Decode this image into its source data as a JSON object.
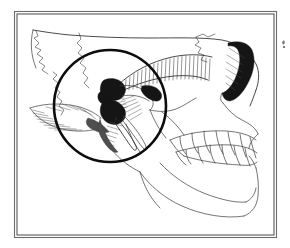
{
  "figure": {
    "title": "Lateral skull illustration with temporomandibular joint highlighted",
    "caption": "",
    "background_color": "#ffffff",
    "ink_color": "#2b2b2b",
    "frame": {
      "name": "image-border",
      "style": "double thin rectangle",
      "color_outer": "#6d6d6d",
      "color_inner": "#4a4a4a",
      "x": 14,
      "y": 11,
      "width": 263,
      "height": 227
    },
    "highlight": {
      "name": "tmj-highlight-circle",
      "shape": "circle",
      "color": "#0d0d0d",
      "stroke_width": 2.6,
      "center_x": 110,
      "center_y": 106,
      "radius": 56,
      "encircles": "temporomandibular joint"
    },
    "orientation": "left lateral view, face pointing right",
    "technique": "pen and ink line drawing with crosshatch shading",
    "anatomy": [
      {
        "id": "cranial-vault",
        "label": "Cranial vault",
        "shaded": false
      },
      {
        "id": "coronal-suture",
        "label": "Coronal suture",
        "shaded": false
      },
      {
        "id": "squamosal-suture",
        "label": "Squamosal suture",
        "shaded": false
      },
      {
        "id": "lambdoid-suture",
        "label": "Lambdoid suture",
        "shaded": false
      },
      {
        "id": "occipital-bone",
        "label": "Occipital bone",
        "shaded": false
      },
      {
        "id": "mastoid-process",
        "label": "Mastoid process",
        "shaded": true
      },
      {
        "id": "external-acoustic-meatus",
        "label": "External acoustic meatus",
        "shaded": true
      },
      {
        "id": "mandibular-condyle",
        "label": "Mandibular condyle",
        "shaded": true
      },
      {
        "id": "articular-disc",
        "label": "Articular disc",
        "shaded": true
      },
      {
        "id": "mandibular-fossa",
        "label": "Mandibular fossa",
        "shaded": true
      },
      {
        "id": "styloid-process",
        "label": "Styloid process",
        "shaded": false
      },
      {
        "id": "zygomatic-arch",
        "label": "Zygomatic arch",
        "shaded": true
      },
      {
        "id": "temporal-fossa",
        "label": "Temporal fossa",
        "shaded": true
      },
      {
        "id": "orbit",
        "label": "Orbital rim",
        "shaded": true
      },
      {
        "id": "maxilla",
        "label": "Maxilla",
        "shaded": false
      },
      {
        "id": "upper-dentition",
        "label": "Upper teeth",
        "shaded": false
      },
      {
        "id": "lower-dentition",
        "label": "Lower teeth",
        "shaded": false
      },
      {
        "id": "mandibular-ramus",
        "label": "Mandibular ramus",
        "shaded": false
      },
      {
        "id": "mandibular-body",
        "label": "Mandibular body",
        "shaded": false
      },
      {
        "id": "mental-protuberance",
        "label": "Chin",
        "shaded": false
      }
    ],
    "stray_mark": {
      "name": "stray-speck",
      "x": 283,
      "y": 44
    }
  }
}
